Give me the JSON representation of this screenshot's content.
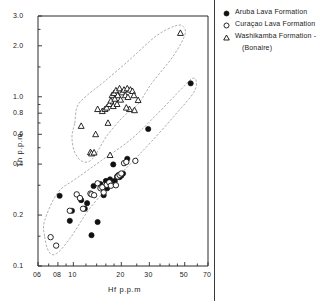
{
  "chart_data": {
    "type": "scatter",
    "title": "",
    "xlabel": "Hf  p.p.m",
    "ylabel": "Th  p.p.m",
    "xscale": "log",
    "yscale": "log",
    "xlim": [
      0.6,
      7.0
    ],
    "ylim": [
      0.1,
      3.0
    ],
    "grid": false,
    "legend_position": "right",
    "xticks": [
      {
        "value": 0.6,
        "label": "06"
      },
      {
        "value": 0.8,
        "label": "08"
      },
      {
        "value": 1.0,
        "label": "10"
      },
      {
        "value": 2.0,
        "label": "20"
      },
      {
        "value": 3.0,
        "label": "30"
      },
      {
        "value": 5.0,
        "label": "50"
      },
      {
        "value": 7.0,
        "label": "70"
      }
    ],
    "yticks": [
      {
        "value": 3.0,
        "label": "3.0"
      },
      {
        "value": 2.0,
        "label": "2.0"
      },
      {
        "value": 1.0,
        "label": "1.0"
      },
      {
        "value": 0.8,
        "label": "0.8"
      },
      {
        "value": 0.6,
        "label": "0.6"
      },
      {
        "value": 0.4,
        "label": "0.4"
      },
      {
        "value": 0.2,
        "label": "0.2"
      },
      {
        "value": 0.1,
        "label": "0.1"
      }
    ],
    "yminorticks": [
      2.5,
      1.5,
      0.9,
      0.7,
      0.5,
      0.3,
      0.15
    ],
    "xminorticks": [
      0.7,
      0.9,
      1.2,
      1.4,
      1.6,
      1.8,
      2.5,
      3.5,
      4.0,
      4.5,
      6.0
    ],
    "series": [
      {
        "name": "Aruba Lava Formation",
        "marker": "filled-circle",
        "color": "#111111",
        "points": [
          [
            0.82,
            0.26
          ],
          [
            0.95,
            0.185
          ],
          [
            0.98,
            0.212
          ],
          [
            1.12,
            0.245
          ],
          [
            1.18,
            0.218
          ],
          [
            1.22,
            0.235
          ],
          [
            1.3,
            0.152
          ],
          [
            1.34,
            0.297
          ],
          [
            1.42,
            0.182
          ],
          [
            1.48,
            0.305
          ],
          [
            1.55,
            0.262
          ],
          [
            1.6,
            0.318
          ],
          [
            1.63,
            0.288
          ],
          [
            1.7,
            0.325
          ],
          [
            1.78,
            0.398
          ],
          [
            1.82,
            0.318
          ],
          [
            1.88,
            0.338
          ],
          [
            1.92,
            0.345
          ],
          [
            1.95,
            0.335
          ],
          [
            2.0,
            0.342
          ],
          [
            2.05,
            0.352
          ],
          [
            2.18,
            0.43
          ],
          [
            2.95,
            0.645
          ],
          [
            5.45,
            1.2
          ]
        ]
      },
      {
        "name": "Curaçao Lava Formation",
        "marker": "open-circle",
        "color": "#111111",
        "points": [
          [
            0.72,
            0.148
          ],
          [
            0.78,
            0.132
          ],
          [
            0.95,
            0.212
          ],
          [
            1.05,
            0.265
          ],
          [
            1.1,
            0.252
          ],
          [
            1.15,
            0.218
          ],
          [
            1.28,
            0.268
          ],
          [
            1.3,
            0.265
          ],
          [
            1.35,
            0.262
          ],
          [
            1.42,
            0.308
          ],
          [
            1.48,
            0.288
          ],
          [
            1.52,
            0.292
          ],
          [
            1.55,
            0.272
          ],
          [
            1.62,
            0.302
          ],
          [
            1.68,
            0.312
          ],
          [
            1.72,
            0.298
          ],
          [
            1.85,
            0.3
          ],
          [
            1.9,
            0.338
          ],
          [
            1.95,
            0.345
          ],
          [
            2.0,
            0.352
          ],
          [
            2.08,
            0.405
          ],
          [
            2.15,
            0.412
          ],
          [
            2.45,
            0.418
          ]
        ]
      },
      {
        "name": "Washikamba Formation - (Bonaire)",
        "marker": "open-triangle",
        "color": "#111111",
        "points": [
          [
            1.12,
            0.672
          ],
          [
            1.28,
            0.47
          ],
          [
            1.3,
            0.462
          ],
          [
            1.35,
            0.468
          ],
          [
            1.38,
            0.6
          ],
          [
            1.42,
            0.845
          ],
          [
            1.52,
            0.822
          ],
          [
            1.58,
            0.845
          ],
          [
            1.62,
            0.862
          ],
          [
            1.68,
            0.905
          ],
          [
            1.72,
            0.948
          ],
          [
            1.75,
            1.02
          ],
          [
            1.78,
            0.88
          ],
          [
            1.8,
            1.05
          ],
          [
            1.82,
            0.972
          ],
          [
            1.85,
            1.09
          ],
          [
            1.88,
            0.905
          ],
          [
            1.9,
            1.02
          ],
          [
            1.95,
            1.12
          ],
          [
            1.98,
            0.96
          ],
          [
            2.02,
            1.06
          ],
          [
            2.08,
            1.1
          ],
          [
            2.12,
            1.02
          ],
          [
            2.18,
            1.12
          ],
          [
            2.2,
            0.995
          ],
          [
            2.28,
            1.1
          ],
          [
            2.35,
            1.08
          ],
          [
            2.4,
            1.02
          ],
          [
            1.65,
            0.7
          ],
          [
            1.7,
            0.452
          ],
          [
            2.25,
            0.845
          ],
          [
            2.42,
            0.832
          ],
          [
            2.15,
            0.862
          ],
          [
            2.55,
            0.955
          ],
          [
            4.7,
            2.38
          ]
        ]
      }
    ],
    "envelopes": [
      {
        "name": "washikamba-envelope",
        "vertices": [
          [
            1.02,
            0.7
          ],
          [
            1.06,
            0.88
          ],
          [
            1.22,
            1.02
          ],
          [
            1.55,
            1.22
          ],
          [
            2.2,
            1.62
          ],
          [
            3.3,
            2.28
          ],
          [
            4.35,
            2.62
          ],
          [
            4.9,
            2.6
          ],
          [
            5.0,
            2.3
          ],
          [
            4.2,
            1.72
          ],
          [
            3.1,
            1.2
          ],
          [
            2.55,
            0.905
          ],
          [
            2.05,
            0.76
          ],
          [
            1.62,
            0.585
          ],
          [
            1.32,
            0.43
          ],
          [
            1.14,
            0.415
          ],
          [
            1.02,
            0.47
          ],
          [
            0.98,
            0.578
          ]
        ]
      },
      {
        "name": "aruba-curacao-envelope",
        "vertices": [
          [
            0.66,
            0.15
          ],
          [
            0.66,
            0.185
          ],
          [
            0.8,
            0.272
          ],
          [
            1.05,
            0.33
          ],
          [
            1.5,
            0.42
          ],
          [
            2.3,
            0.56
          ],
          [
            3.4,
            0.8
          ],
          [
            4.8,
            1.12
          ],
          [
            5.55,
            1.28
          ],
          [
            5.9,
            1.24
          ],
          [
            5.7,
            1.06
          ],
          [
            4.4,
            0.79
          ],
          [
            3.1,
            0.545
          ],
          [
            2.3,
            0.405
          ],
          [
            1.7,
            0.3
          ],
          [
            1.25,
            0.215
          ],
          [
            0.95,
            0.145
          ],
          [
            0.78,
            0.118
          ],
          [
            0.7,
            0.122
          ]
        ]
      }
    ]
  },
  "legend": {
    "entries": [
      {
        "symbol": "filled-circle",
        "label": "Aruba Lava Formation",
        "sublabel": ""
      },
      {
        "symbol": "open-circle",
        "label": "Curaçao Lava Formation",
        "sublabel": ""
      },
      {
        "symbol": "open-triangle",
        "label": "Washikamba Formation -",
        "sublabel": "(Bonaire)"
      }
    ]
  }
}
